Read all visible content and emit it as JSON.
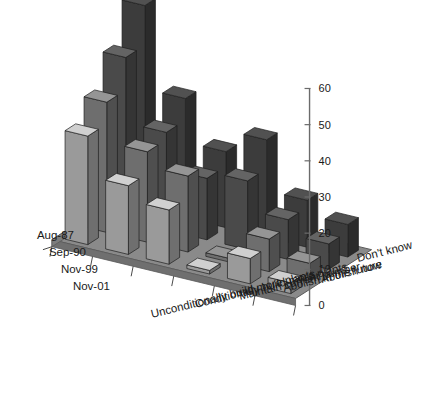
{
  "chart_data": {
    "type": "bar",
    "title": "",
    "subtitle": "",
    "xlabel": "",
    "ylabel": "",
    "zlabel": "",
    "projection": "3d",
    "grid": false,
    "legend_position": "none",
    "ylim": [
      0,
      60
    ],
    "ytick_labels": [
      "0",
      "10",
      "20",
      "30",
      "40",
      "50",
      "60"
    ],
    "ytick_values": [
      0,
      10,
      20,
      30,
      40,
      50,
      60
    ],
    "categories": [
      "Unconditionally build more plants",
      "Conditionally build more plants",
      "Maintain current number",
      "Abolish in the future",
      "Abolish now",
      "Don't know"
    ],
    "series": [
      {
        "name": "Aug-87",
        "color": "#3c3c3c",
        "values": [
          56,
          33,
          21,
          27,
          13,
          9
        ]
      },
      {
        "name": "Sep-90",
        "color": "#4a4a4a",
        "values": [
          45,
          27,
          17,
          19,
          11,
          7
        ]
      },
      {
        "name": "Nov-99",
        "color": "#6e6e6e",
        "values": [
          36,
          25,
          21,
          1,
          9,
          5
        ]
      },
      {
        "name": "Nov-01",
        "color": "#9a9a9a",
        "values": [
          30,
          19,
          15,
          1,
          7,
          3
        ]
      }
    ]
  },
  "axis": {
    "y_ticks": [
      {
        "label": "60",
        "value": 60
      },
      {
        "label": "50",
        "value": 50
      },
      {
        "label": "40",
        "value": 40
      },
      {
        "label": "30",
        "value": 30
      },
      {
        "label": "20",
        "value": 20
      },
      {
        "label": "10",
        "value": 10
      },
      {
        "label": "0",
        "value": 0
      }
    ]
  },
  "series_labels": [
    {
      "text": "Aug-87"
    },
    {
      "text": "Sep-90"
    },
    {
      "text": "Nov-99"
    },
    {
      "text": "Nov-01"
    }
  ],
  "category_labels": [
    {
      "text": "Unconditionally build more plants"
    },
    {
      "text": "Conditionally build more plants"
    },
    {
      "text": "Maintain current number"
    },
    {
      "text": "Abolish in the future"
    },
    {
      "text": "Abolish now"
    },
    {
      "text": "Don't know"
    }
  ],
  "colors": {
    "floor": "#8a8a8a",
    "floor_edge": "#5a5a5a",
    "axis_line": "#6b6b6b",
    "text": "#1a1a1a",
    "background": "#ffffff"
  }
}
